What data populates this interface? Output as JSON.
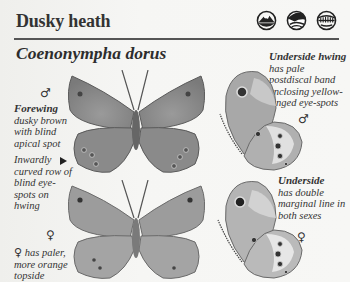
{
  "header": {
    "common_name": "Dusky heath",
    "latin_name": "Coenonympha dorus",
    "habitat_icons": [
      "mountain-habitat-icon",
      "hillside-grassland-habitat-icon",
      "scrub-meadow-habitat-icon"
    ]
  },
  "notes": {
    "male_upper_symbol": "♂",
    "forewing_title": "Forewing",
    "forewing_text": "dusky brown with blind apical spot",
    "hwing_row_text": "Inwardly curved row of blind eye-spots on hwing",
    "female_upper_symbol": "♀",
    "female_note_symbol": "♀",
    "female_note_text": "has paler, more orange topside",
    "underside_hwing_title": "Underside hwing",
    "underside_hwing_text": "has pale postdiscal band enclosing yellow-ringed eye-spots",
    "male_under_symbol": "♂",
    "underside_title": "Underside",
    "underside_text": "has double marginal line in both sexes",
    "female_under_symbol": "♀"
  },
  "colors": {
    "page": "#f3f3f1",
    "rule": "#555555",
    "wing_dark": "#6e6e6e",
    "wing_mid": "#8a8a8a",
    "wing_light": "#b5b5b5",
    "text": "#2a2a2a"
  }
}
